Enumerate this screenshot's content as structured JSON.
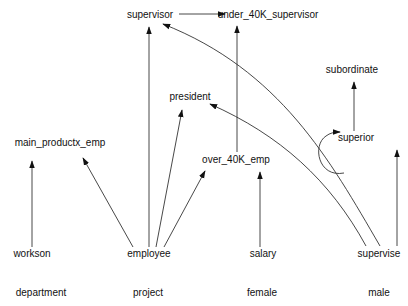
{
  "diagram": {
    "type": "directed-graph",
    "nodes": [
      {
        "id": "supervisor",
        "label": "supervisor"
      },
      {
        "id": "under_40K_supervisor",
        "label": "under_40K_supervisor"
      },
      {
        "id": "subordinate",
        "label": "subordinate"
      },
      {
        "id": "president",
        "label": "president"
      },
      {
        "id": "main_productx_emp",
        "label": "main_productx_emp"
      },
      {
        "id": "superior",
        "label": "superior"
      },
      {
        "id": "over_40K_emp",
        "label": "over_40K_emp"
      },
      {
        "id": "workson",
        "label": "workson"
      },
      {
        "id": "employee",
        "label": "employee"
      },
      {
        "id": "salary",
        "label": "salary"
      },
      {
        "id": "supervise",
        "label": "supervise"
      },
      {
        "id": "department",
        "label": "department"
      },
      {
        "id": "project",
        "label": "project"
      },
      {
        "id": "female",
        "label": "female"
      },
      {
        "id": "male",
        "label": "male"
      }
    ],
    "edges": [
      {
        "from": "supervisor",
        "to": "under_40K_supervisor"
      },
      {
        "from": "employee",
        "to": "supervisor"
      },
      {
        "from": "employee",
        "to": "president"
      },
      {
        "from": "employee",
        "to": "over_40K_emp"
      },
      {
        "from": "employee",
        "to": "main_productx_emp"
      },
      {
        "from": "workson",
        "to": "main_productx_emp"
      },
      {
        "from": "over_40K_emp",
        "to": "under_40K_supervisor"
      },
      {
        "from": "salary",
        "to": "over_40K_emp"
      },
      {
        "from": "supervise",
        "to": "supervisor"
      },
      {
        "from": "supervise",
        "to": "president"
      },
      {
        "from": "supervise",
        "to": "superior"
      },
      {
        "from": "superior",
        "to": "superior"
      },
      {
        "from": "superior",
        "to": "subordinate"
      }
    ]
  }
}
